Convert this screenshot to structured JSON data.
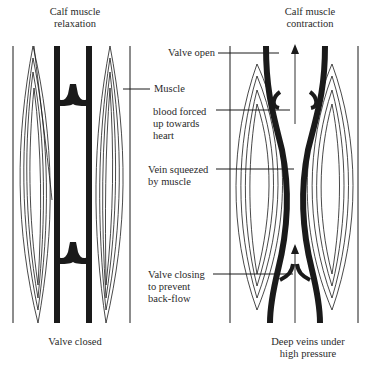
{
  "figure": {
    "left_panel": {
      "title": "Calf muscle\nrelaxation",
      "caption": "Valve closed"
    },
    "right_panel": {
      "title": "Calf muscle\ncontraction",
      "caption": "Deep veins under\nhigh pressure"
    },
    "annotations": [
      {
        "id": "valve-open",
        "text": "Valve open"
      },
      {
        "id": "muscle",
        "text": "Muscle"
      },
      {
        "id": "blood-forced",
        "text": "blood forced\nup towards\nheart"
      },
      {
        "id": "vein-squeezed",
        "text": "Vein squeezed\nby muscle"
      },
      {
        "id": "valve-closing",
        "text": "Valve closing\nto prevent\nback-flow"
      }
    ],
    "colors": {
      "ink": "#1a1a1a",
      "text": "#2a2a2a",
      "background": "#ffffff"
    }
  }
}
